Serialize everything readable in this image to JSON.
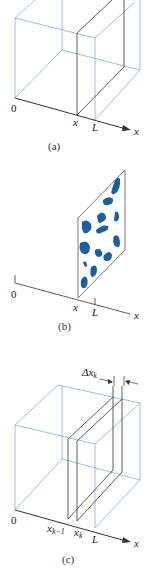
{
  "colors": {
    "box_edge": "#7fb0d6",
    "slice_edge": "#333333",
    "axis": "#333333",
    "blob": "#1a5fa3",
    "background": "#ffffff"
  },
  "panels": [
    {
      "id": "a",
      "caption": "(a)",
      "origin_label": "0",
      "slice_label": "x",
      "end_label": "L",
      "axis_label": "x"
    },
    {
      "id": "b",
      "caption": "(b)",
      "origin_label": "0",
      "slice_label": "x",
      "end_label": "L",
      "axis_label": "x"
    },
    {
      "id": "c",
      "caption": "(c)",
      "origin_label": "0",
      "left_slice_label": "x",
      "left_slice_sub": "k−1",
      "right_slice_label": "x",
      "right_slice_sub": "k",
      "end_label": "L",
      "axis_label": "x",
      "delta_label": "Δx",
      "delta_sub": "k"
    }
  ]
}
